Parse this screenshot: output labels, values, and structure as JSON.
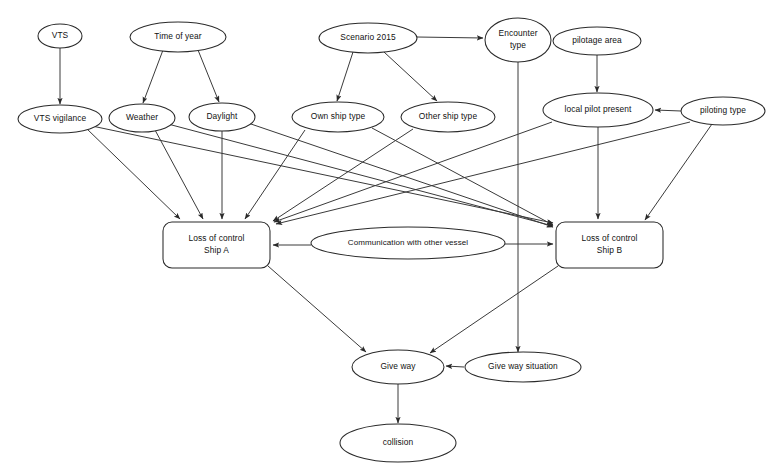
{
  "diagram": {
    "type": "directed-acyclic-graph",
    "stroke_color": "#2a2a2a",
    "text_color": "#111111",
    "background_color": "#ffffff"
  },
  "nodes": [
    {
      "id": "vts",
      "label": "VTS",
      "lines": [
        "VTS"
      ],
      "shape": "ellipse",
      "cx": 60,
      "cy": 36,
      "rx": 22,
      "ry": 12
    },
    {
      "id": "time_of_year",
      "label": "Time of year",
      "lines": [
        "Time of year"
      ],
      "shape": "ellipse",
      "cx": 178,
      "cy": 37,
      "rx": 48,
      "ry": 15
    },
    {
      "id": "scenario_2015",
      "label": "Scenario 2015",
      "lines": [
        "Scenario 2015"
      ],
      "shape": "ellipse",
      "cx": 368,
      "cy": 38,
      "rx": 49,
      "ry": 15
    },
    {
      "id": "encounter_type",
      "label": "Encounter type",
      "lines": [
        "Encounter",
        "type"
      ],
      "shape": "ellipse",
      "cx": 518,
      "cy": 40,
      "rx": 33,
      "ry": 22
    },
    {
      "id": "pilotage_area",
      "label": "pilotage area",
      "lines": [
        "pilotage area"
      ],
      "shape": "ellipse",
      "cx": 597,
      "cy": 41,
      "rx": 44,
      "ry": 14
    },
    {
      "id": "vts_vigilance",
      "label": "VTS vigilance",
      "lines": [
        "VTS vigilance"
      ],
      "shape": "ellipse",
      "cx": 60,
      "cy": 119,
      "rx": 42,
      "ry": 14
    },
    {
      "id": "weather",
      "label": "Weather",
      "lines": [
        "Weather"
      ],
      "shape": "ellipse",
      "cx": 142,
      "cy": 118,
      "rx": 33,
      "ry": 14
    },
    {
      "id": "daylight",
      "label": "Daylight",
      "lines": [
        "Daylight"
      ],
      "shape": "ellipse",
      "cx": 222,
      "cy": 117,
      "rx": 33,
      "ry": 14
    },
    {
      "id": "own_ship_type",
      "label": "Own ship type",
      "lines": [
        "Own ship type"
      ],
      "shape": "ellipse",
      "cx": 338,
      "cy": 117,
      "rx": 46,
      "ry": 15
    },
    {
      "id": "other_ship_type",
      "label": "Other ship type",
      "lines": [
        "Other ship type"
      ],
      "shape": "ellipse",
      "cx": 448,
      "cy": 117,
      "rx": 47,
      "ry": 15
    },
    {
      "id": "local_pilot",
      "label": "local pilot present",
      "lines": [
        "local pilot present"
      ],
      "shape": "ellipse",
      "cx": 598,
      "cy": 110,
      "rx": 55,
      "ry": 17
    },
    {
      "id": "piloting_type",
      "label": "piloting type",
      "lines": [
        "piloting type"
      ],
      "shape": "ellipse",
      "cx": 723,
      "cy": 111,
      "rx": 42,
      "ry": 14
    },
    {
      "id": "loss_ship_a",
      "label": "Loss of control Ship A",
      "lines": [
        "Loss of control",
        "Ship A"
      ],
      "shape": "roundrect",
      "x": 163,
      "y": 222,
      "w": 107,
      "h": 46
    },
    {
      "id": "communication",
      "label": "Communication with other vessel",
      "lines": [
        "Communication with other vessel"
      ],
      "shape": "ellipse",
      "cx": 408,
      "cy": 243,
      "rx": 97,
      "ry": 16
    },
    {
      "id": "loss_ship_b",
      "label": "Loss of control Ship B",
      "lines": [
        "Loss of control",
        "Ship B"
      ],
      "shape": "roundrect",
      "x": 556,
      "y": 222,
      "w": 107,
      "h": 46
    },
    {
      "id": "give_way",
      "label": "Give way",
      "lines": [
        "Give way"
      ],
      "shape": "ellipse",
      "cx": 398,
      "cy": 367,
      "rx": 46,
      "ry": 17
    },
    {
      "id": "give_way_sit",
      "label": "Give way situation",
      "lines": [
        "Give way situation"
      ],
      "shape": "ellipse",
      "cx": 523,
      "cy": 367,
      "rx": 58,
      "ry": 15
    },
    {
      "id": "collision",
      "label": "collision",
      "lines": [
        "collision"
      ],
      "shape": "ellipse",
      "cx": 398,
      "cy": 443,
      "rx": 58,
      "ry": 19
    }
  ],
  "edges": [
    {
      "from": "vts",
      "to": "vts_vigilance",
      "x1": 60,
      "y1": 48,
      "x2": 60,
      "y2": 104
    },
    {
      "from": "time_of_year",
      "to": "weather",
      "x1": 163,
      "y1": 50,
      "x2": 143,
      "y2": 103
    },
    {
      "from": "time_of_year",
      "to": "daylight",
      "x1": 198,
      "y1": 50,
      "x2": 219,
      "y2": 102
    },
    {
      "from": "scenario_2015",
      "to": "encounter_type",
      "x1": 417,
      "y1": 37,
      "x2": 483,
      "y2": 38
    },
    {
      "from": "scenario_2015",
      "to": "own_ship_type",
      "x1": 353,
      "y1": 52,
      "x2": 337,
      "y2": 101
    },
    {
      "from": "scenario_2015",
      "to": "other_ship_type",
      "x1": 384,
      "y1": 52,
      "x2": 437,
      "y2": 101
    },
    {
      "from": "pilotage_area",
      "to": "local_pilot",
      "x1": 597,
      "y1": 55,
      "x2": 597,
      "y2": 92
    },
    {
      "from": "piloting_type",
      "to": "local_pilot",
      "x1": 681,
      "y1": 111,
      "x2": 655,
      "y2": 110
    },
    {
      "from": "vts_vigilance",
      "to": "loss_ship_a",
      "x1": 86,
      "y1": 128,
      "x2": 180,
      "y2": 219
    },
    {
      "from": "weather",
      "to": "loss_ship_a",
      "x1": 155,
      "y1": 130,
      "x2": 203,
      "y2": 219
    },
    {
      "from": "daylight",
      "to": "loss_ship_a",
      "x1": 222,
      "y1": 131,
      "x2": 222,
      "y2": 219
    },
    {
      "from": "own_ship_type",
      "to": "loss_ship_a",
      "x1": 305,
      "y1": 130,
      "x2": 245,
      "y2": 219
    },
    {
      "from": "vts_vigilance",
      "to": "loss_ship_b",
      "x1": 92,
      "y1": 126,
      "x2": 553,
      "y2": 223
    },
    {
      "from": "weather",
      "to": "loss_ship_b",
      "x1": 168,
      "y1": 124,
      "x2": 553,
      "y2": 226
    },
    {
      "from": "daylight",
      "to": "loss_ship_b",
      "x1": 248,
      "y1": 123,
      "x2": 553,
      "y2": 227
    },
    {
      "from": "own_ship_type",
      "to": "loss_ship_b",
      "x1": 372,
      "y1": 128,
      "x2": 553,
      "y2": 225
    },
    {
      "from": "other_ship_type",
      "to": "loss_ship_a",
      "x1": 413,
      "y1": 129,
      "x2": 273,
      "y2": 221
    },
    {
      "from": "local_pilot",
      "to": "loss_ship_a",
      "x1": 552,
      "y1": 122,
      "x2": 274,
      "y2": 222
    },
    {
      "from": "piloting_type",
      "to": "loss_ship_a",
      "x1": 690,
      "y1": 122,
      "x2": 276,
      "y2": 224
    },
    {
      "from": "local_pilot",
      "to": "loss_ship_b",
      "x1": 598,
      "y1": 127,
      "x2": 598,
      "y2": 219
    },
    {
      "from": "piloting_type",
      "to": "loss_ship_b",
      "x1": 712,
      "y1": 124,
      "x2": 645,
      "y2": 220
    },
    {
      "from": "communication",
      "to": "loss_ship_a",
      "x1": 311,
      "y1": 245,
      "x2": 273,
      "y2": 245
    },
    {
      "from": "communication",
      "to": "loss_ship_b",
      "x1": 505,
      "y1": 244,
      "x2": 553,
      "y2": 244
    },
    {
      "from": "encounter_type",
      "to": "give_way_sit",
      "x1": 518,
      "y1": 62,
      "x2": 518,
      "y2": 352
    },
    {
      "from": "loss_ship_a",
      "to": "give_way",
      "x1": 268,
      "y1": 266,
      "x2": 366,
      "y2": 352
    },
    {
      "from": "loss_ship_b",
      "to": "give_way",
      "x1": 558,
      "y1": 266,
      "x2": 430,
      "y2": 353
    },
    {
      "from": "give_way_sit",
      "to": "give_way",
      "x1": 464,
      "y1": 367,
      "x2": 446,
      "y2": 366
    },
    {
      "from": "give_way",
      "to": "collision",
      "x1": 398,
      "y1": 384,
      "x2": 398,
      "y2": 423
    }
  ]
}
